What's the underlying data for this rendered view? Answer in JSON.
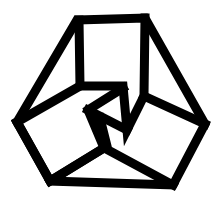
{
  "image": {
    "description": "Black line-art geometric logo: a hexagonal outline containing three interlocking folded square shapes meeting at the center",
    "colors": {
      "stroke": "#000000",
      "background": "#ffffff"
    },
    "alt_text": "Geometric interlocking hexagon logo"
  }
}
